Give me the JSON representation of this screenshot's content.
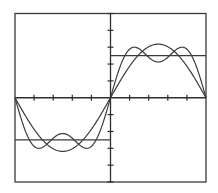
{
  "chart_data": {
    "type": "line",
    "title": "",
    "xlabel": "",
    "ylabel": "",
    "xlim": [
      -3.14159,
      3.14159
    ],
    "ylim": [
      -5,
      5
    ],
    "grid": false,
    "legend": null,
    "x_ticks": 10,
    "y_ticks": 10,
    "series": [
      {
        "name": "square-wave",
        "kind": "square",
        "amplitude": 2.5,
        "description": "Square wave: -2.5 for x<0, +2.5 for x>0"
      },
      {
        "name": "fundamental",
        "kind": "fourier",
        "harmonics": [
          1
        ],
        "amplitude": 2.5,
        "peak": 3.18,
        "description": "(4/pi)*2.5*sin(x)"
      },
      {
        "name": "fundamental-plus-third",
        "kind": "fourier",
        "harmonics": [
          1,
          3
        ],
        "amplitude": 2.5,
        "peak": 3.0,
        "dip_at_center": 2.12,
        "description": "(4/pi)*2.5*(sin(x)+sin(3x)/3)"
      }
    ]
  },
  "layout": {
    "plot_left": 15,
    "plot_right": 206,
    "plot_top": 13.5,
    "plot_bottom": 182,
    "line_color": "#3a3a3a",
    "background": "#ffffff"
  }
}
